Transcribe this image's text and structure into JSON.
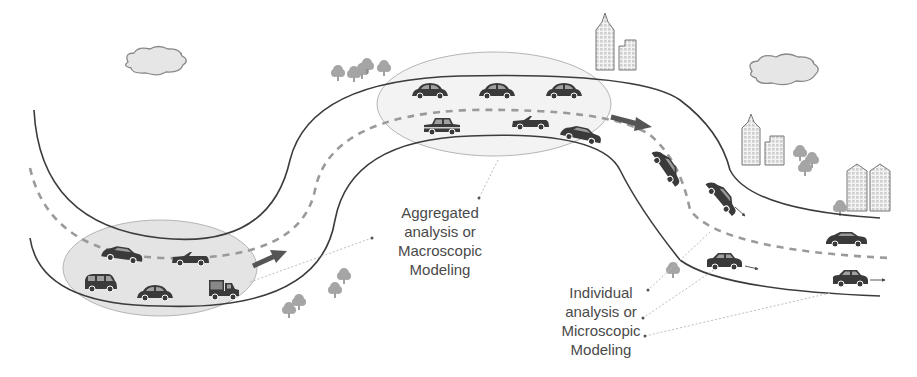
{
  "diagram": {
    "title": "",
    "colors": {
      "road_edge": "#3c3c3c",
      "lane_divider": "#9a9a9a",
      "aggregation_ellipse_fill": "#e4e4e4",
      "flow_arrow": "#555555",
      "leader_line": "#bdbdbd",
      "car": "#3a3a3a",
      "tree": "#9a9a9a",
      "cloud_fill": "#e6e6e6",
      "building_fill": "#f2f2f2",
      "text": "#4a4a4a"
    },
    "labels": {
      "macroscopic": {
        "lines": [
          "Aggregated",
          "analysis or",
          "Macroscopic",
          "Modeling"
        ]
      },
      "microscopic": {
        "lines": [
          "Individual",
          "analysis or",
          "Microscopic",
          "Modeling"
        ]
      }
    },
    "regions": [
      {
        "name": "left-aggregation-ellipse",
        "vehicles": [
          "sedan",
          "convertible",
          "minivan",
          "beetle",
          "pickup-truck"
        ]
      },
      {
        "name": "top-aggregation-ellipse",
        "vehicles": [
          "beetle",
          "beetle",
          "beetle",
          "hatchback",
          "convertible",
          "sedan"
        ]
      },
      {
        "name": "individual-vehicles",
        "vehicles": [
          "sedan",
          "sedan",
          "hatchback",
          "sedan",
          "hatchback"
        ]
      }
    ],
    "decorations": [
      "cloud",
      "cloud",
      "tree-cluster",
      "tree-cluster",
      "building-pair",
      "building-pair",
      "building-pair"
    ]
  }
}
